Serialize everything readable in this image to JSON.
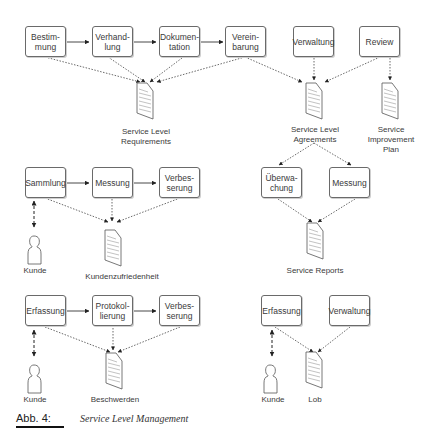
{
  "caption": {
    "number": "Abb. 4:",
    "title": "Service Level Management"
  },
  "sections": {
    "slr": {
      "boxes": [
        "Bestim-\nmung",
        "Verhand-\nlung",
        "Dokumen-\ntation",
        "Verein-\nbarung"
      ],
      "document": "Service Level\nRequirements"
    },
    "sla": {
      "boxes": [
        "Verwaltung"
      ],
      "document": "Service Level\nAgreements",
      "sub_boxes": [
        "Überwa-\nchung",
        "Messung"
      ],
      "sub_document": "Service Reports"
    },
    "sip": {
      "boxes": [
        "Review"
      ],
      "document": "Service\nImprovement\nPlan"
    },
    "satisfaction": {
      "boxes": [
        "Sammlung",
        "Messung",
        "Verbes-\nserung"
      ],
      "actor": "Kunde",
      "document": "Kundenzufriedenheit"
    },
    "complaints": {
      "boxes": [
        "Erfassung",
        "Protokol-\nlierung",
        "Verbes-\nserung"
      ],
      "actor": "Kunde",
      "document": "Beschwerden"
    },
    "praise": {
      "boxes": [
        "Erfassung",
        "Verwaltung"
      ],
      "actor": "Kunde",
      "document": "Lob"
    }
  },
  "colors": {
    "line": "#333333",
    "box_border": "#6a6a6a",
    "doc_lines": "#9a9a9a"
  }
}
